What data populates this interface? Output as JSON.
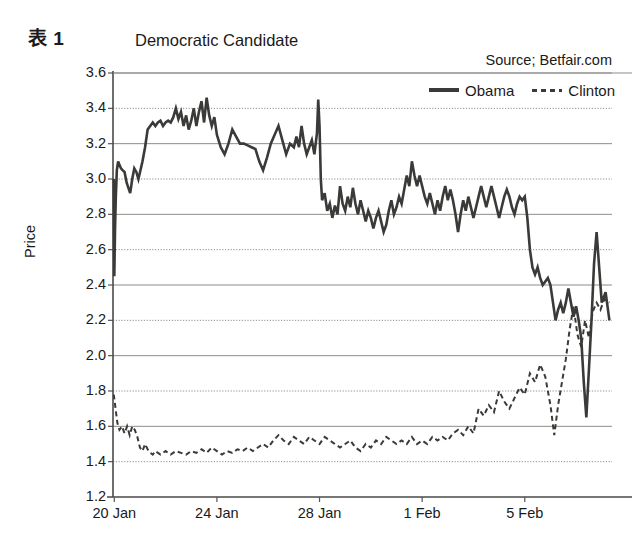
{
  "header": {
    "figure_number": "表 1",
    "title": "Democratic Candidate",
    "source": "Source; Betfair.com"
  },
  "legend": {
    "position": "top-right",
    "entries": [
      {
        "label": "Obama",
        "style": "solid",
        "color": "#3a3a38"
      },
      {
        "label": "Clinton",
        "style": "dashed",
        "color": "#3a3a38"
      }
    ]
  },
  "axes": {
    "ylabel": "Price",
    "xlabel": "",
    "yticks": [
      "3.6",
      "3.4",
      "3.2",
      "3.0",
      "2.8",
      "2.6",
      "2.4",
      "2.2",
      "2.0",
      "1.8",
      "1.6",
      "1.4",
      "1.2"
    ],
    "xticks": [
      "20 Jan",
      "24 Jan",
      "28 Jan",
      "1 Feb",
      "5 Feb"
    ],
    "ylim": [
      1.2,
      3.6
    ],
    "grid": "horizontal"
  },
  "chart_data": {
    "type": "line",
    "title": "Democratic Candidate",
    "subtitle": "Source; Betfair.com",
    "xlabel": "",
    "ylabel": "Price",
    "ylim": [
      1.2,
      3.6
    ],
    "ytick_step": 0.2,
    "grid": true,
    "legend_position": "top-right",
    "x_axis_type": "date",
    "x_tick_labels": [
      "20 Jan",
      "24 Jan",
      "28 Jan",
      "1 Feb",
      "5 Feb"
    ],
    "x_tick_days": [
      0,
      4,
      8,
      12,
      16
    ],
    "x_range_days": [
      -0.05,
      19.4
    ],
    "series": [
      {
        "name": "Obama",
        "style": "solid",
        "color": "#3a3a38",
        "x_days": [
          -0.02,
          0.0,
          0.03,
          0.06,
          0.1,
          0.15,
          0.2,
          0.26,
          0.32,
          0.4,
          0.48,
          0.55,
          0.62,
          0.7,
          0.78,
          0.86,
          0.94,
          1.02,
          1.1,
          1.2,
          1.3,
          1.4,
          1.5,
          1.6,
          1.7,
          1.8,
          1.9,
          2.0,
          2.1,
          2.2,
          2.3,
          2.4,
          2.5,
          2.6,
          2.7,
          2.8,
          2.9,
          3.0,
          3.1,
          3.2,
          3.3,
          3.4,
          3.5,
          3.6,
          3.7,
          3.8,
          3.9,
          4.0,
          4.15,
          4.3,
          4.45,
          4.6,
          4.75,
          4.9,
          5.05,
          5.2,
          5.35,
          5.5,
          5.65,
          5.8,
          5.95,
          6.1,
          6.25,
          6.4,
          6.55,
          6.7,
          6.85,
          7.0,
          7.1,
          7.2,
          7.3,
          7.4,
          7.5,
          7.6,
          7.7,
          7.8,
          7.9,
          7.95,
          8.0,
          8.05,
          8.1,
          8.2,
          8.3,
          8.4,
          8.5,
          8.6,
          8.7,
          8.8,
          8.9,
          9.0,
          9.1,
          9.2,
          9.3,
          9.4,
          9.5,
          9.6,
          9.7,
          9.8,
          9.9,
          10.0,
          10.1,
          10.2,
          10.3,
          10.4,
          10.5,
          10.6,
          10.7,
          10.8,
          10.9,
          11.0,
          11.1,
          11.2,
          11.3,
          11.4,
          11.5,
          11.6,
          11.7,
          11.8,
          11.9,
          12.0,
          12.1,
          12.2,
          12.3,
          12.4,
          12.5,
          12.6,
          12.7,
          12.8,
          12.9,
          13.0,
          13.1,
          13.2,
          13.3,
          13.4,
          13.5,
          13.6,
          13.7,
          13.8,
          13.9,
          14.0,
          14.1,
          14.2,
          14.3,
          14.4,
          14.5,
          14.6,
          14.7,
          14.8,
          14.9,
          15.0,
          15.1,
          15.2,
          15.3,
          15.4,
          15.5,
          15.6,
          15.7,
          15.8,
          15.9,
          16.0,
          16.1,
          16.2,
          16.3,
          16.4,
          16.5,
          16.6,
          16.7,
          16.8,
          16.9,
          17.0,
          17.1,
          17.2,
          17.3,
          17.4,
          17.5,
          17.6,
          17.7,
          17.8,
          17.9,
          18.0,
          18.1,
          18.2,
          18.3,
          18.4,
          18.5,
          18.6,
          18.7,
          18.8,
          18.9,
          19.0,
          19.15,
          19.3
        ],
        "y": [
          3.0,
          2.45,
          2.72,
          2.9,
          3.05,
          3.1,
          3.08,
          3.06,
          3.05,
          3.04,
          2.98,
          2.95,
          2.92,
          3.0,
          3.06,
          3.04,
          3.0,
          3.05,
          3.1,
          3.18,
          3.28,
          3.3,
          3.32,
          3.3,
          3.32,
          3.33,
          3.3,
          3.32,
          3.33,
          3.32,
          3.35,
          3.4,
          3.34,
          3.38,
          3.3,
          3.36,
          3.28,
          3.33,
          3.4,
          3.3,
          3.38,
          3.44,
          3.32,
          3.46,
          3.36,
          3.3,
          3.35,
          3.25,
          3.18,
          3.14,
          3.2,
          3.28,
          3.24,
          3.2,
          3.2,
          3.19,
          3.18,
          3.17,
          3.1,
          3.05,
          3.12,
          3.2,
          3.25,
          3.3,
          3.22,
          3.14,
          3.2,
          3.18,
          3.24,
          3.18,
          3.3,
          3.2,
          3.14,
          3.18,
          3.22,
          3.14,
          3.26,
          3.45,
          3.3,
          3.0,
          2.88,
          2.92,
          2.82,
          2.86,
          2.78,
          2.85,
          2.8,
          2.96,
          2.86,
          2.82,
          2.9,
          2.84,
          2.95,
          2.86,
          2.8,
          2.88,
          2.82,
          2.76,
          2.82,
          2.78,
          2.72,
          2.78,
          2.82,
          2.76,
          2.7,
          2.74,
          2.82,
          2.88,
          2.8,
          2.84,
          2.9,
          2.86,
          2.94,
          3.02,
          2.96,
          3.1,
          3.02,
          2.96,
          3.02,
          2.96,
          2.9,
          2.86,
          2.92,
          2.86,
          2.8,
          2.88,
          2.82,
          2.9,
          2.96,
          2.88,
          2.94,
          2.88,
          2.8,
          2.7,
          2.8,
          2.88,
          2.82,
          2.9,
          2.84,
          2.78,
          2.84,
          2.9,
          2.96,
          2.9,
          2.84,
          2.9,
          2.96,
          2.9,
          2.84,
          2.78,
          2.84,
          2.9,
          2.94,
          2.9,
          2.84,
          2.8,
          2.86,
          2.9,
          2.88,
          2.9,
          2.78,
          2.6,
          2.5,
          2.46,
          2.5,
          2.44,
          2.4,
          2.42,
          2.44,
          2.4,
          2.3,
          2.2,
          2.26,
          2.3,
          2.24,
          2.3,
          2.38,
          2.3,
          2.22,
          2.28,
          2.2,
          2.1,
          1.85,
          1.65,
          1.92,
          2.2,
          2.52,
          2.7,
          2.5,
          2.3,
          2.36,
          2.2,
          2.05,
          1.92,
          1.95,
          1.9,
          1.93,
          1.85,
          1.8,
          1.76,
          1.78,
          1.72,
          1.76
        ]
      },
      {
        "name": "Clinton",
        "style": "dashed",
        "color": "#3a3a38",
        "x_days": [
          -0.02,
          0.05,
          0.12,
          0.2,
          0.3,
          0.4,
          0.5,
          0.6,
          0.7,
          0.8,
          0.9,
          1.0,
          1.1,
          1.2,
          1.3,
          1.4,
          1.5,
          1.6,
          1.8,
          2.0,
          2.2,
          2.4,
          2.6,
          2.8,
          3.0,
          3.2,
          3.4,
          3.6,
          3.8,
          4.0,
          4.2,
          4.4,
          4.6,
          4.8,
          5.0,
          5.2,
          5.4,
          5.6,
          5.8,
          6.0,
          6.2,
          6.4,
          6.6,
          6.8,
          7.0,
          7.2,
          7.4,
          7.6,
          7.8,
          8.0,
          8.2,
          8.4,
          8.6,
          8.8,
          9.0,
          9.2,
          9.4,
          9.6,
          9.8,
          10.0,
          10.2,
          10.4,
          10.6,
          10.8,
          11.0,
          11.2,
          11.4,
          11.6,
          11.8,
          12.0,
          12.2,
          12.4,
          12.6,
          12.8,
          13.0,
          13.2,
          13.4,
          13.6,
          13.8,
          14.0,
          14.2,
          14.4,
          14.6,
          14.8,
          15.0,
          15.2,
          15.4,
          15.6,
          15.8,
          16.0,
          16.2,
          16.4,
          16.6,
          16.8,
          17.0,
          17.15,
          17.3,
          17.45,
          17.6,
          17.75,
          17.9,
          18.05,
          18.2,
          18.35,
          18.5,
          18.65,
          18.8,
          18.95,
          19.1,
          19.3
        ],
        "y": [
          1.78,
          1.7,
          1.62,
          1.58,
          1.6,
          1.56,
          1.6,
          1.55,
          1.6,
          1.58,
          1.54,
          1.48,
          1.46,
          1.5,
          1.47,
          1.45,
          1.44,
          1.46,
          1.44,
          1.46,
          1.44,
          1.46,
          1.45,
          1.44,
          1.46,
          1.45,
          1.47,
          1.45,
          1.48,
          1.46,
          1.44,
          1.46,
          1.45,
          1.47,
          1.46,
          1.48,
          1.46,
          1.48,
          1.5,
          1.48,
          1.52,
          1.55,
          1.52,
          1.5,
          1.54,
          1.52,
          1.5,
          1.54,
          1.52,
          1.5,
          1.54,
          1.52,
          1.5,
          1.48,
          1.5,
          1.52,
          1.48,
          1.46,
          1.5,
          1.48,
          1.52,
          1.5,
          1.54,
          1.52,
          1.5,
          1.52,
          1.5,
          1.54,
          1.5,
          1.52,
          1.5,
          1.54,
          1.52,
          1.54,
          1.52,
          1.56,
          1.58,
          1.55,
          1.6,
          1.56,
          1.7,
          1.66,
          1.72,
          1.68,
          1.8,
          1.74,
          1.7,
          1.76,
          1.82,
          1.78,
          1.9,
          1.85,
          1.95,
          1.88,
          1.72,
          1.55,
          1.72,
          1.85,
          1.98,
          2.15,
          2.28,
          2.12,
          2.05,
          2.2,
          2.1,
          2.25,
          2.3,
          2.26,
          2.32,
          2.3
        ]
      }
    ]
  }
}
